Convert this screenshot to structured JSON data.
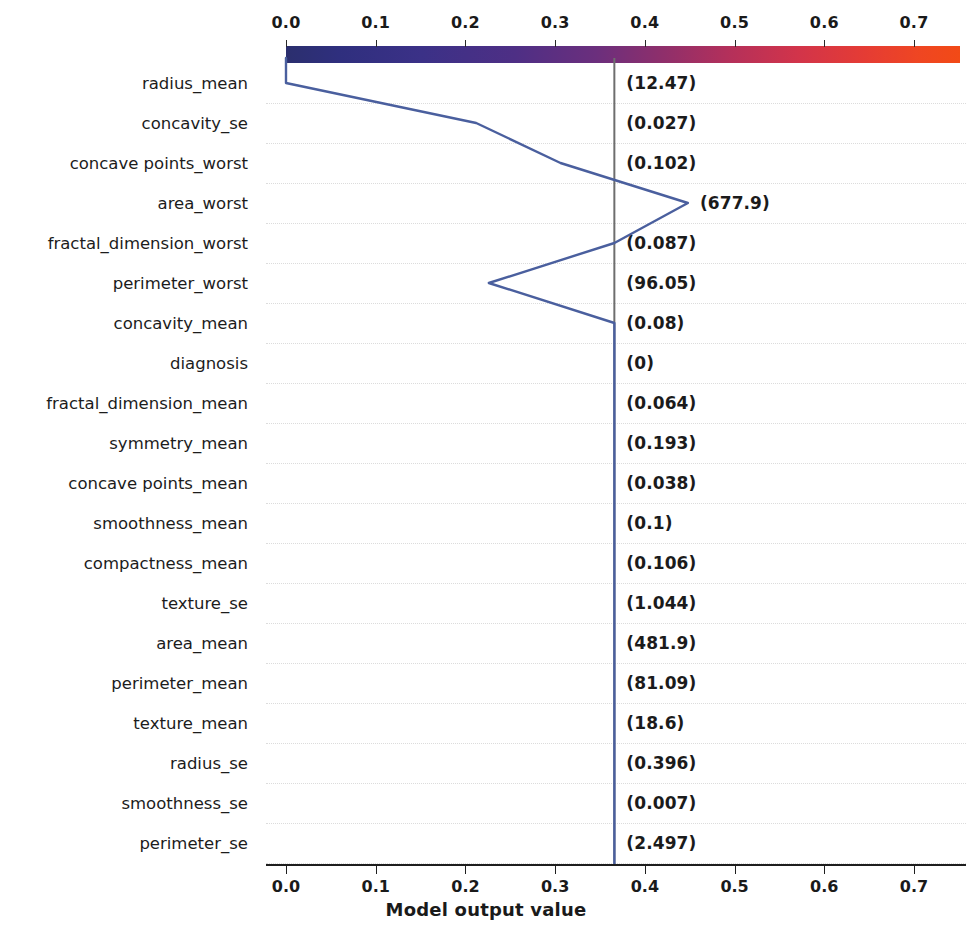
{
  "figure": {
    "type": "shap-decision-plot",
    "xaxis_title": "Model output value",
    "colorbar_colors": {
      "low": "#2b2f6e",
      "mid": "#8f2f6b",
      "high": "#f24a16"
    },
    "line_color": "#4a5f9e",
    "reference_line_color": "#6e6e6e",
    "axis_color": "#1e1e1e",
    "gridline_color": "#dcdcdc"
  },
  "top_axis": {
    "ticks": [
      "0.0",
      "0.1",
      "0.2",
      "0.3",
      "0.4",
      "0.5",
      "0.6",
      "0.7"
    ],
    "values": [
      0.0,
      0.1,
      0.2,
      0.3,
      0.4,
      0.5,
      0.6,
      0.7
    ]
  },
  "bottom_axis": {
    "ticks": [
      "0.0",
      "0.1",
      "0.2",
      "0.3",
      "0.4",
      "0.5",
      "0.6",
      "0.7"
    ],
    "values": [
      0.0,
      0.1,
      0.2,
      0.3,
      0.4,
      0.5,
      0.6,
      0.7
    ],
    "label": "Model output value"
  },
  "chart_data": {
    "type": "line",
    "title": "",
    "subtitle": "",
    "xlabel": "Model output value",
    "ylabel": "",
    "xlim": [
      -0.024,
      0.75
    ],
    "grid": true,
    "legend": "none",
    "base_value": 0.0,
    "model_output": 0.366,
    "reference_line_x": 0.366,
    "annotations_note": "Parenthesized text after each feature name is that feature's raw value for the explained instance.",
    "categories": [
      "radius_mean",
      "concavity_se",
      "concave points_worst",
      "area_worst",
      "fractal_dimension_worst",
      "perimeter_worst",
      "concavity_mean",
      "diagnosis",
      "fractal_dimension_mean",
      "symmetry_mean",
      "concave points_mean",
      "smoothness_mean",
      "compactness_mean",
      "texture_se",
      "area_mean",
      "perimeter_mean",
      "texture_mean",
      "radius_se",
      "smoothness_se",
      "perimeter_se"
    ],
    "feature_values": [
      "(12.47)",
      "(0.027)",
      "(0.102)",
      "(677.9)",
      "(0.087)",
      "(96.05)",
      "(0.08)",
      "(0)",
      "(0.064)",
      "(0.193)",
      "(0.038)",
      "(0.1)",
      "(0.106)",
      "(1.044)",
      "(481.9)",
      "(81.09)",
      "(18.6)",
      "(0.396)",
      "(0.007)",
      "(2.497)"
    ],
    "cumulative_x": [
      0.0,
      0.212,
      0.306,
      0.448,
      0.366,
      0.226,
      0.366,
      0.366,
      0.366,
      0.366,
      0.366,
      0.366,
      0.366,
      0.366,
      0.366,
      0.366,
      0.366,
      0.366,
      0.366,
      0.366
    ],
    "series": [
      {
        "name": "instance-path",
        "values": [
          0.0,
          0.212,
          0.306,
          0.448,
          0.366,
          0.226,
          0.366,
          0.366,
          0.366,
          0.366,
          0.366,
          0.366,
          0.366,
          0.366,
          0.366,
          0.366,
          0.366,
          0.366,
          0.366,
          0.366
        ]
      }
    ]
  }
}
